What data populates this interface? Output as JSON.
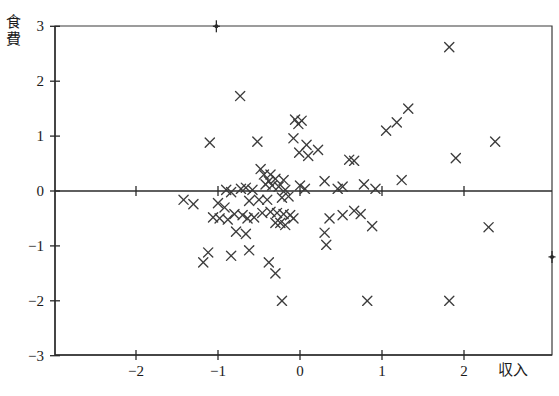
{
  "chart_data": {
    "type": "scatter",
    "title": "",
    "xlabel": "収入",
    "ylabel": "食費",
    "xlim": [
      -2.95,
      3.1
    ],
    "ylim": [
      -3,
      3
    ],
    "xticks": [
      -2,
      -1,
      0,
      1,
      2
    ],
    "xticklabels": [
      "−2",
      "−1",
      "0",
      "1",
      "2"
    ],
    "yticks": [
      3,
      2,
      1,
      0,
      -1,
      -2,
      -3
    ],
    "yticklabels": [
      "3",
      "2",
      "1",
      "0",
      "−1",
      "−2",
      "−3"
    ],
    "grid": false,
    "legend": null,
    "marker": "x",
    "marker_color": "#3c3c3c",
    "zero_line_y": 0,
    "points": [
      [
        1.82,
        2.62
      ],
      [
        -0.73,
        1.73
      ],
      [
        1.32,
        1.5
      ],
      [
        1.18,
        1.25
      ],
      [
        -0.06,
        1.3
      ],
      [
        -0.02,
        1.22
      ],
      [
        0.02,
        1.28
      ],
      [
        1.05,
        1.1
      ],
      [
        2.38,
        0.9
      ],
      [
        -1.1,
        0.88
      ],
      [
        -0.52,
        0.9
      ],
      [
        -0.08,
        0.96
      ],
      [
        0.08,
        0.84
      ],
      [
        0.22,
        0.75
      ],
      [
        -0.01,
        0.7
      ],
      [
        0.1,
        0.64
      ],
      [
        0.6,
        0.57
      ],
      [
        0.66,
        0.55
      ],
      [
        1.9,
        0.6
      ],
      [
        -0.48,
        0.4
      ],
      [
        -0.44,
        0.3
      ],
      [
        -0.36,
        0.3
      ],
      [
        -0.38,
        0.18
      ],
      [
        -0.3,
        0.22
      ],
      [
        -0.42,
        0.12
      ],
      [
        -0.34,
        0.1
      ],
      [
        -0.26,
        0.08
      ],
      [
        -0.2,
        0.2
      ],
      [
        -0.66,
        0.06
      ],
      [
        -0.72,
        0.04
      ],
      [
        -0.9,
        0.02
      ],
      [
        -0.84,
        -0.02
      ],
      [
        -0.58,
        0.02
      ],
      [
        -0.18,
        0.02
      ],
      [
        0.0,
        0.1
      ],
      [
        0.06,
        0.04
      ],
      [
        0.3,
        0.18
      ],
      [
        0.46,
        0.04
      ],
      [
        0.52,
        0.08
      ],
      [
        0.78,
        0.12
      ],
      [
        0.92,
        0.04
      ],
      [
        1.24,
        0.2
      ],
      [
        -0.14,
        -0.1
      ],
      [
        -0.22,
        -0.12
      ],
      [
        -0.4,
        -0.16
      ],
      [
        -0.5,
        -0.16
      ],
      [
        -0.62,
        -0.18
      ],
      [
        -1.42,
        -0.16
      ],
      [
        -1.3,
        -0.24
      ],
      [
        -1.0,
        -0.22
      ],
      [
        -0.92,
        -0.3
      ],
      [
        -1.06,
        -0.48
      ],
      [
        -0.98,
        -0.5
      ],
      [
        -0.88,
        -0.52
      ],
      [
        -0.8,
        -0.42
      ],
      [
        -0.7,
        -0.44
      ],
      [
        -0.64,
        -0.5
      ],
      [
        -0.56,
        -0.48
      ],
      [
        -0.46,
        -0.4
      ],
      [
        -0.36,
        -0.38
      ],
      [
        -0.28,
        -0.4
      ],
      [
        -0.2,
        -0.42
      ],
      [
        -0.12,
        -0.44
      ],
      [
        -0.3,
        -0.58
      ],
      [
        -0.24,
        -0.58
      ],
      [
        -0.18,
        -0.62
      ],
      [
        -0.08,
        -0.5
      ],
      [
        0.36,
        -0.5
      ],
      [
        0.52,
        -0.44
      ],
      [
        0.66,
        -0.36
      ],
      [
        0.74,
        -0.42
      ],
      [
        0.88,
        -0.64
      ],
      [
        2.3,
        -0.66
      ],
      [
        -0.66,
        -0.78
      ],
      [
        -0.78,
        -0.74
      ],
      [
        0.3,
        -0.76
      ],
      [
        0.32,
        -0.98
      ],
      [
        -1.12,
        -1.12
      ],
      [
        -0.84,
        -1.18
      ],
      [
        -0.62,
        -1.08
      ],
      [
        -1.18,
        -1.3
      ],
      [
        -0.38,
        -1.3
      ],
      [
        -0.3,
        -1.5
      ],
      [
        -0.22,
        -2.0
      ],
      [
        0.82,
        -2.0
      ],
      [
        1.82,
        -2.0
      ]
    ],
    "edge_markers": [
      {
        "position": "top",
        "x": -1.02,
        "y": 3
      },
      {
        "position": "right",
        "x": 3.08,
        "y": -1.2
      }
    ]
  },
  "axes": {
    "y_axis_title": "食費",
    "x_axis_title": "収入"
  }
}
